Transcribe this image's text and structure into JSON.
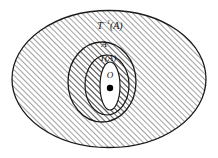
{
  "figure": {
    "background_color": "#ffffff",
    "stroke_color": "#1a1a1a",
    "hatch_color": "#4a4a4a",
    "hatch_direction": "forward-slash",
    "width": 218,
    "height": 158
  },
  "regions": [
    {
      "id": "t-inverse-a",
      "label": "T",
      "label_superscript": "−1",
      "label_suffix": "(A)",
      "label_full": "T⁻¹(A)",
      "shaded": true,
      "fill": "hatched",
      "cx": 109,
      "cy": 79,
      "rx": 98,
      "ry": 69,
      "label_x": 110,
      "label_y": 27
    },
    {
      "id": "set-a",
      "label": "A",
      "label_superscript": "",
      "label_suffix": "",
      "label_full": "A",
      "shaded": true,
      "fill": "hatched",
      "cx": 102,
      "cy": 82,
      "rx": 34,
      "ry": 40,
      "label_x": 104,
      "label_y": 45
    },
    {
      "id": "t-of-a",
      "label": "T",
      "label_superscript": "",
      "label_suffix": "(A)",
      "label_full": "T(A)",
      "shaded": true,
      "fill": "hatched",
      "cx": 107,
      "cy": 85,
      "rx": 22,
      "ry": 30,
      "label_x": 108,
      "label_y": 59
    },
    {
      "id": "origin-neighborhood",
      "label": "",
      "label_superscript": "",
      "label_suffix": "",
      "label_full": "",
      "shaded": false,
      "fill": "white",
      "cx": 110,
      "cy": 86,
      "rx": 10,
      "ry": 24,
      "label_x": 110,
      "label_y": 86
    }
  ],
  "origin": {
    "label": "O",
    "label_x": 110,
    "label_y": 76,
    "point_x": 110,
    "point_y": 88,
    "point_radius": 3.2,
    "point_color": "#000000"
  },
  "label_sizes": {
    "outer": 10,
    "middle": 9,
    "inner": 9,
    "origin": 9
  }
}
